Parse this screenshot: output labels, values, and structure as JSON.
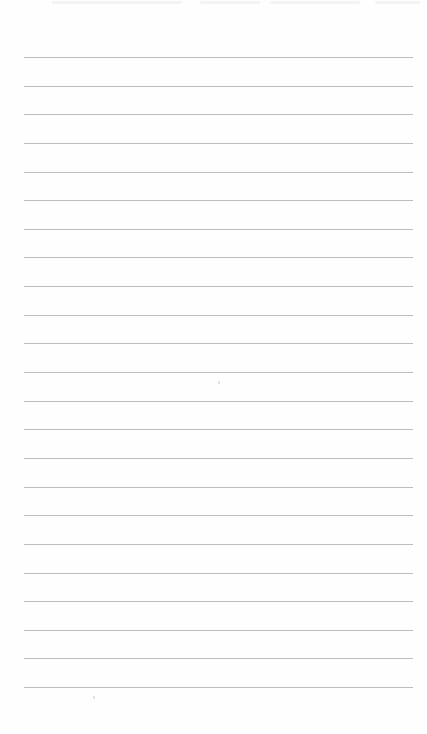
{
  "document": {
    "type": "lined-paper",
    "background_color": "#fefefe",
    "rule_color": "#bdbdbd",
    "rule_count": 23,
    "rule_start_y": 57,
    "rule_spacing": 28.64,
    "rule_left": 24,
    "rule_right": 413,
    "text_content": ""
  }
}
